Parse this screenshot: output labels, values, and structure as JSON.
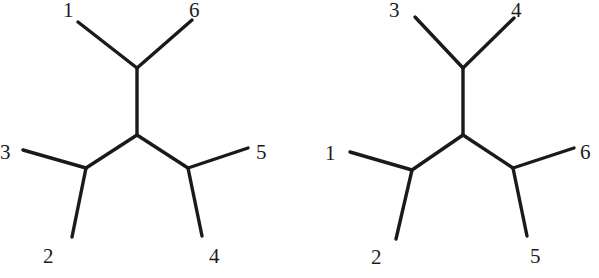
{
  "figure": {
    "width": 599,
    "height": 278,
    "background": "#ffffff",
    "line_color": "#1a1a1a",
    "label_color": "#1c1c1c",
    "line_width": 3.4,
    "type": "unrooted-phylogenetic-trees",
    "tree_count": 2
  },
  "trees": [
    {
      "id": "left-tree",
      "name": "unrooted-tree-left",
      "topology": "((1,6),(2,3),(4,5))",
      "nodes": {
        "center": {
          "x": 137,
          "y": 135
        },
        "top": {
          "x": 137,
          "y": 68
        },
        "left": {
          "x": 86,
          "y": 168
        },
        "right": {
          "x": 188,
          "y": 168
        }
      },
      "internal_edges": [
        {
          "name": "center-to-top",
          "x1": 137,
          "y1": 135,
          "x2": 137,
          "y2": 68
        },
        {
          "name": "center-to-left",
          "x1": 137,
          "y1": 135,
          "x2": 86,
          "y2": 168
        },
        {
          "name": "center-to-right",
          "x1": 137,
          "y1": 135,
          "x2": 188,
          "y2": 168
        }
      ],
      "leaves": [
        {
          "label": "1",
          "from": "top",
          "tip_x": 78,
          "tip_y": 22,
          "label_x": 63,
          "label_y": 0
        },
        {
          "label": "6",
          "from": "top",
          "tip_x": 192,
          "tip_y": 20,
          "label_x": 189,
          "label_y": 0
        },
        {
          "label": "3",
          "from": "left",
          "tip_x": 23,
          "tip_y": 150,
          "label_x": 0,
          "label_y": 142
        },
        {
          "label": "2",
          "from": "left",
          "tip_x": 72,
          "tip_y": 237,
          "label_x": 43,
          "label_y": 246
        },
        {
          "label": "5",
          "from": "right",
          "tip_x": 248,
          "tip_y": 148,
          "label_x": 256,
          "label_y": 142
        },
        {
          "label": "4",
          "from": "right",
          "tip_x": 202,
          "tip_y": 236,
          "label_x": 209,
          "label_y": 246
        }
      ]
    },
    {
      "id": "right-tree",
      "name": "unrooted-tree-right",
      "topology": "((3,4),(1,2),(5,6))",
      "nodes": {
        "center": {
          "x": 463,
          "y": 135
        },
        "top": {
          "x": 463,
          "y": 68
        },
        "left": {
          "x": 412,
          "y": 170
        },
        "right": {
          "x": 513,
          "y": 168
        }
      },
      "internal_edges": [
        {
          "name": "center-to-top",
          "x1": 463,
          "y1": 135,
          "x2": 463,
          "y2": 68
        },
        {
          "name": "center-to-left",
          "x1": 463,
          "y1": 135,
          "x2": 412,
          "y2": 170
        },
        {
          "name": "center-to-right",
          "x1": 463,
          "y1": 135,
          "x2": 513,
          "y2": 168
        }
      ],
      "leaves": [
        {
          "label": "3",
          "from": "top",
          "tip_x": 415,
          "tip_y": 17,
          "label_x": 389,
          "label_y": 0
        },
        {
          "label": "4",
          "from": "top",
          "tip_x": 514,
          "tip_y": 18,
          "label_x": 511,
          "label_y": 0
        },
        {
          "label": "1",
          "from": "left",
          "tip_x": 350,
          "tip_y": 152,
          "label_x": 325,
          "label_y": 143
        },
        {
          "label": "2",
          "from": "left",
          "tip_x": 396,
          "tip_y": 239,
          "label_x": 371,
          "label_y": 247
        },
        {
          "label": "6",
          "from": "right",
          "tip_x": 574,
          "tip_y": 148,
          "label_x": 580,
          "label_y": 142
        },
        {
          "label": "5",
          "from": "right",
          "tip_x": 527,
          "tip_y": 236,
          "label_x": 530,
          "label_y": 246
        }
      ]
    }
  ]
}
